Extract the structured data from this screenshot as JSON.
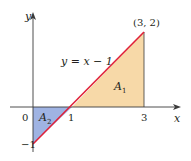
{
  "diagram": {
    "line_equation": "y = x − 1",
    "point_label": "(3, 2)",
    "region_1": {
      "label": "A",
      "sub": "1",
      "color": "#f7d9a8"
    },
    "region_2": {
      "label": "A",
      "sub": "2",
      "color": "#9fb3e3"
    },
    "line_color": "#e0223a",
    "axis_color": "#3a3a3a",
    "x_axis_label": "x",
    "y_axis_label": "y",
    "tick_labels": {
      "origin": "0",
      "x1": "1",
      "x3": "3",
      "ym1": "−1"
    }
  }
}
